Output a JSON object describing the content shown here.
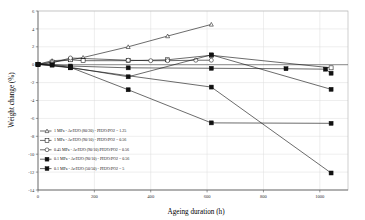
{
  "chart_data": {
    "type": "line",
    "title": "",
    "xlabel": "Ageing duration  (h)",
    "ylabel": "Weight change  (%)",
    "xlim": [
      0,
      1100
    ],
    "ylim": [
      -14,
      6
    ],
    "xticks": [
      0,
      200,
      400,
      600,
      800,
      1000
    ],
    "xticklabels": [
      "0",
      "200",
      "400",
      "600",
      "800",
      "1000"
    ],
    "yticks": [
      6,
      4,
      2,
      0,
      -2,
      -4,
      -6,
      -8,
      -10,
      -12,
      -14
    ],
    "yticklabels": [
      "6",
      "4",
      "2",
      "0",
      "-2",
      "-4",
      "-6",
      "-8",
      "-10",
      "-12",
      "-14"
    ],
    "grid": true,
    "legend_position": "lower-left-inside",
    "series": [
      {
        "name": "1 MPa - Ar/H2O (80/20) - PH2O/PO2 = 1.25",
        "marker": "triangle-open",
        "color": "#111111",
        "x": [
          0,
          50,
          115,
          160,
          320,
          460,
          615
        ],
        "y": [
          0.05,
          0.45,
          0.55,
          0.8,
          2.0,
          3.2,
          4.5
        ]
      },
      {
        "name": "1 MPa - Ar/H2O (90/10) - PH2O/PO2 = 0.56",
        "marker": "square-open",
        "color": "#111111",
        "x": [
          0,
          50,
          115,
          160,
          320,
          460,
          615,
          1040
        ],
        "y": [
          0.05,
          0.3,
          0.55,
          0.45,
          0.45,
          0.55,
          1.05,
          -0.35
        ]
      },
      {
        "name": "0.45 MPa - Ar/H2O (90/10) PH2O/PO2 = 0.56",
        "marker": "circle-open",
        "color": "#111111",
        "x": [
          0,
          50,
          115,
          320,
          400,
          460,
          560,
          615
        ],
        "y": [
          0.05,
          0.2,
          0.75,
          0.5,
          0.45,
          0.45,
          0.5,
          0.5
        ]
      },
      {
        "name": "0.1 MPa - Ar/H2O (90/10) - PH2O/PO2 = 0.56",
        "marker": "square-filled",
        "color": "#111111",
        "x": [
          0,
          50,
          115,
          320,
          615,
          880,
          1020,
          1040
        ],
        "y": [
          0.05,
          0.0,
          -0.15,
          -0.35,
          -0.4,
          -0.45,
          -0.5,
          -0.95
        ]
      },
      {
        "name": "0.1 MPa - Ar/H2O (50/50) - PH2O/PO2 = 5",
        "marker": "square-filled",
        "color": "#111111",
        "x": [
          0,
          50,
          115,
          320,
          615,
          1040
        ],
        "y": [
          0.05,
          -0.05,
          -0.3,
          -1.35,
          1.1,
          -2.75
        ]
      },
      {
        "name": "series-decline-mid",
        "marker": "square-filled",
        "color": "#111111",
        "x": [
          0,
          115,
          320,
          615,
          1040
        ],
        "y": [
          0.05,
          -0.3,
          -2.8,
          -6.5,
          -6.55
        ]
      },
      {
        "name": "series-decline-steep",
        "marker": "square-filled",
        "color": "#111111",
        "x": [
          0,
          115,
          615,
          1040
        ],
        "y": [
          0.05,
          -0.35,
          -2.5,
          -12.1
        ]
      }
    ],
    "legend_entries": [
      {
        "marker": "triangle-open",
        "label": "1 MPa - Ar/H2O (80/20) - PH2O/PO2 = 1.25"
      },
      {
        "marker": "square-open",
        "label": "1 MPa - Ar/H2O (90/10) - PH2O/PO2 = 0.56"
      },
      {
        "marker": "circle-open",
        "label": "0.45 MPa - Ar/H2O (90/10) PH2O/PO2 = 0.56"
      },
      {
        "marker": "square-filled",
        "label": "0.1 MPa - Ar/H2O (90/10) - PH2O/PO2 = 0.56"
      },
      {
        "marker": "square-filled",
        "label": "0.1 MPa - Ar/H2O (50/50) - PH2O/PO2 = 5"
      }
    ]
  }
}
